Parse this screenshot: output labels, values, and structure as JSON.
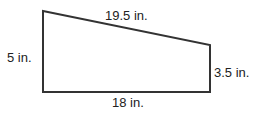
{
  "diagram": {
    "type": "right-trapezoid",
    "stroke_color": "#333333",
    "vertices": {
      "top_left": [
        43,
        11
      ],
      "top_right": [
        210,
        45
      ],
      "bottom_right": [
        210,
        92
      ],
      "bottom_left": [
        43,
        92
      ]
    },
    "labels": {
      "top_side": "19.5 in.",
      "left_side": "5 in.",
      "right_side": "3.5 in.",
      "bottom_side": "18 in."
    }
  }
}
